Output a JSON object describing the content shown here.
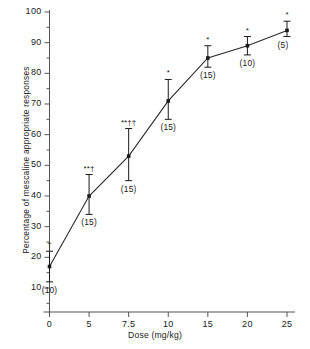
{
  "chart_data": {
    "type": "line",
    "title": "",
    "xlabel": "Dose (mg/kg)",
    "ylabel": "Percentage of mescaline appropriate responses",
    "grid": false,
    "legend": null,
    "x_tick_labels": [
      "0",
      "5",
      "7.5",
      "10",
      "15",
      "20",
      "25"
    ],
    "x_values": [
      0,
      5,
      7.5,
      10,
      15,
      20,
      25
    ],
    "x_spacing": "categorical-even",
    "y_tick_labels": [
      "10",
      "20",
      "30",
      "40",
      "50",
      "60",
      "70",
      "80",
      "90",
      "100"
    ],
    "y_ticks": [
      10,
      20,
      30,
      40,
      50,
      60,
      70,
      80,
      90,
      100
    ],
    "y_minor_ticks": [
      15,
      25,
      35,
      45,
      55,
      65,
      75,
      85,
      95
    ],
    "ylim": [
      5,
      100
    ],
    "values": [
      17,
      40,
      53,
      71,
      85,
      89,
      94
    ],
    "err_upper": [
      22,
      47,
      62,
      78,
      89,
      92,
      97
    ],
    "err_lower": [
      12,
      34,
      45,
      65,
      82,
      86,
      92
    ],
    "n_labels": [
      "(10)",
      "(15)",
      "(15)",
      "(15)",
      "(15)",
      "(10)",
      "(5)"
    ],
    "sig_labels": [
      "†",
      "**†",
      "**††",
      "*",
      "*",
      "*",
      "*"
    ],
    "line_color": "#2a2a2a",
    "marker_color": "#1a1a1a",
    "axis_color": "#555555"
  }
}
